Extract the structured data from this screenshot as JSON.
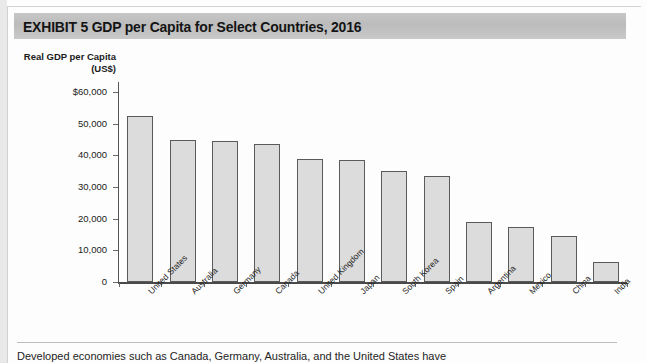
{
  "exhibit": {
    "title": "EXHIBIT 5   GDP per Capita for Select Countries, 2016"
  },
  "caption": {
    "text": "Developed economies such as Canada, Germany, Australia, and the United States have"
  },
  "chart_data": {
    "type": "bar",
    "title": "GDP per Capita for Select Countries, 2016",
    "xlabel": "",
    "ylabel": "Real GDP per Capita (US$)",
    "ylabel_line1": "Real GDP per Capita",
    "ylabel_line2": "(US$)",
    "ylim": [
      0,
      60000
    ],
    "ytick_values": [
      60000,
      50000,
      40000,
      30000,
      20000,
      10000,
      0
    ],
    "ytick_labels": [
      "$60,000",
      "50,000",
      "40,000",
      "30,000",
      "20,000",
      "10,000",
      "0"
    ],
    "grid": false,
    "legend": "none",
    "bar_fill_color": "#dcdcdc",
    "bar_edge_color": "#5a5a5a",
    "categories": [
      "United States",
      "Australia",
      "Germany",
      "Canada",
      "United Kingdom",
      "Japan",
      "South Korea",
      "Spain",
      "Argentina",
      "Mexico",
      "China",
      "India"
    ],
    "values": [
      52400,
      44800,
      44500,
      43500,
      39000,
      38500,
      35200,
      33500,
      19000,
      17300,
      14500,
      6300
    ]
  }
}
